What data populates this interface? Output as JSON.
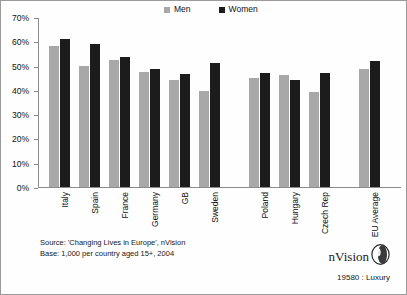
{
  "legend": {
    "entries": [
      {
        "label": "Men",
        "color": "#a8a8a8"
      },
      {
        "label": "Women",
        "color": "#1c1c1c"
      }
    ]
  },
  "axis": {
    "y_ticks": [
      "0%",
      "10%",
      "20%",
      "30%",
      "40%",
      "50%",
      "60%",
      "70%"
    ]
  },
  "footer": {
    "source": "Source: 'Changing Lives in Europe', nVision",
    "base": "Base: 1,000 per country aged 15+, 2004"
  },
  "branding": {
    "name": "nVision",
    "mark": "ring-sphere-icon",
    "code": "19580 : Luxury"
  },
  "chart_data": {
    "type": "bar",
    "title": "",
    "xlabel": "",
    "ylabel": "",
    "ylim": [
      0,
      70
    ],
    "ytick_step": 10,
    "ytick_suffix": "%",
    "grid": false,
    "legend_position": "top",
    "categories": [
      "Italy",
      "Spain",
      "France",
      "Germany",
      "GB",
      "Sweden",
      "Poland",
      "Hungary",
      "Czech Rep",
      "EU Average"
    ],
    "group_breaks_after": [
      "Sweden",
      "Czech Rep"
    ],
    "series": [
      {
        "name": "Men",
        "color": "#a8a8a8",
        "values": [
          58.0,
          50.0,
          52.5,
          47.5,
          44.0,
          39.5,
          45.0,
          46.0,
          39.0,
          48.5
        ]
      },
      {
        "name": "Women",
        "color": "#1c1c1c",
        "values": [
          61.0,
          59.0,
          53.5,
          48.5,
          46.5,
          51.0,
          47.0,
          44.0,
          47.0,
          52.0
        ]
      }
    ]
  }
}
